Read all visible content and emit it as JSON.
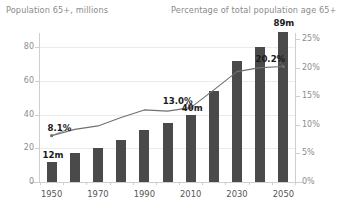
{
  "titles": {
    "left_axis": "Population 65+, millions",
    "right_axis": "Percentage of total population age 65+"
  },
  "colors": {
    "bar": "#4a4a4a",
    "line": "#707070",
    "grid": "#ebebeb",
    "axis": "#cfcfcf",
    "title_text": "#8a8a8a",
    "tick_text": "#8c8c8c",
    "callout_text": "#1a1a1a"
  },
  "axes": {
    "left_ticks": [
      "0",
      "20",
      "40",
      "60",
      "80"
    ],
    "left_values": [
      0,
      20,
      40,
      60,
      80
    ],
    "right_ticks": [
      "0%",
      "5%",
      "10%",
      "15%",
      "20%",
      "25%"
    ],
    "right_values": [
      0,
      5,
      10,
      15,
      20,
      25
    ],
    "x_ticks": [
      "1950",
      "1970",
      "1990",
      "2010",
      "2030",
      "2050"
    ]
  },
  "callouts": [
    {
      "id": "bar-1950",
      "text": "12m"
    },
    {
      "id": "bar-2010",
      "text": "40m"
    },
    {
      "id": "bar-2050",
      "text": "89m"
    },
    {
      "id": "line-1950",
      "text": "8.1%"
    },
    {
      "id": "line-2010",
      "text": "13.0%"
    },
    {
      "id": "line-2050",
      "text": "20.2%"
    }
  ],
  "chart_data": {
    "type": "bar",
    "title": "",
    "categories": [
      "1950",
      "1960",
      "1970",
      "1980",
      "1990",
      "2000",
      "2010",
      "2020",
      "2030",
      "2040",
      "2050"
    ],
    "xlabel": "",
    "series": [
      {
        "name": "Population 65+, millions",
        "type": "bar",
        "axis": "left",
        "ylabel": "Population 65+, millions",
        "ylim": [
          0,
          90
        ],
        "values": [
          12,
          17,
          20,
          25,
          31,
          35,
          40,
          54,
          72,
          80,
          89
        ],
        "labeled_points": {
          "1950": "12m",
          "2010": "40m",
          "2050": "89m"
        }
      },
      {
        "name": "Percentage of total population age 65+",
        "type": "line",
        "axis": "right",
        "ylabel": "Percentage of total population age 65+",
        "ylim": [
          0,
          25
        ],
        "values": [
          8.1,
          9.2,
          9.8,
          11.3,
          12.6,
          12.4,
          13.0,
          16.1,
          19.3,
          20.0,
          20.2
        ],
        "labeled_points": {
          "1950": "8.1%",
          "2010": "13.0%",
          "2050": "20.2%"
        }
      }
    ],
    "grid": true,
    "legend": "none"
  }
}
